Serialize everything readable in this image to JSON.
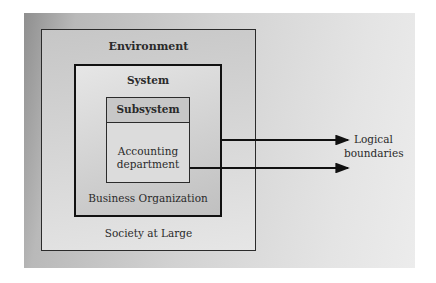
{
  "diagram": {
    "layers": [
      {
        "id": "environment",
        "title": "Environment",
        "caption": "Society at Large"
      },
      {
        "id": "system",
        "title": "System",
        "caption": "Business Organization"
      },
      {
        "id": "subsystem",
        "title": "Subsystem",
        "caption_line1": "Accounting",
        "caption_line2": "department"
      }
    ],
    "annotation": {
      "line1": "Logical",
      "line2": "boundaries"
    },
    "colors": {
      "stroke": "#2b2b2b",
      "arrow": "#111111"
    }
  }
}
